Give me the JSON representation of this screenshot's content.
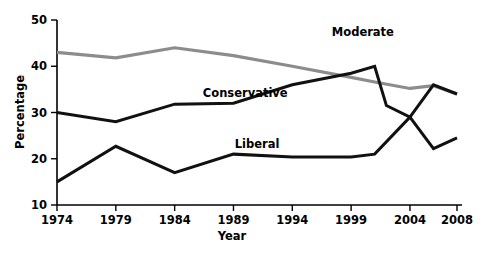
{
  "chart_data": {
    "type": "line",
    "title": "",
    "xlabel": "Year",
    "ylabel": "Percentage",
    "xlim": [
      1974,
      2008
    ],
    "ylim": [
      10,
      50
    ],
    "xticks": [
      1974,
      1979,
      1984,
      1989,
      1994,
      1999,
      2004,
      2008
    ],
    "yticks": [
      10,
      20,
      30,
      40,
      50
    ],
    "xtick_labels": [
      "1974",
      "1979",
      "1984",
      "1989",
      "1994",
      "1999",
      "2004",
      "2008"
    ],
    "ytick_labels": [
      "10",
      "20",
      "30",
      "40",
      "50"
    ],
    "grid": false,
    "legend": "inline-labels",
    "series": [
      {
        "name": "Moderate",
        "color": "#8c8c8c",
        "label_x": 2000,
        "label_y": 47.5,
        "x": [
          1974,
          1979,
          1984,
          1989,
          1994,
          1999,
          2001,
          2004,
          2006,
          2008
        ],
        "values": [
          43.0,
          41.8,
          44.0,
          42.3,
          40.0,
          37.6,
          36.6,
          35.2,
          35.8,
          34.0
        ]
      },
      {
        "name": "Conservative",
        "color": "#111111",
        "label_x": 1990,
        "label_y": 34.2,
        "x": [
          1974,
          1979,
          1984,
          1989,
          1994,
          1999,
          2001,
          2002,
          2004,
          2006,
          2008
        ],
        "values": [
          30.0,
          28.0,
          31.8,
          32.0,
          36.0,
          38.5,
          40.0,
          31.5,
          29.0,
          36.0,
          34.0
        ]
      },
      {
        "name": "Liberal",
        "color": "#111111",
        "label_x": 1991,
        "label_y": 23.2,
        "x": [
          1974,
          1979,
          1984,
          1989,
          1994,
          1999,
          2001,
          2004,
          2006,
          2008
        ],
        "values": [
          15.0,
          22.7,
          17.0,
          21.0,
          20.4,
          20.4,
          21.0,
          29.0,
          22.2,
          24.5
        ]
      }
    ]
  },
  "axes": {
    "ylabel": "Percentage",
    "xlabel": "Year"
  }
}
